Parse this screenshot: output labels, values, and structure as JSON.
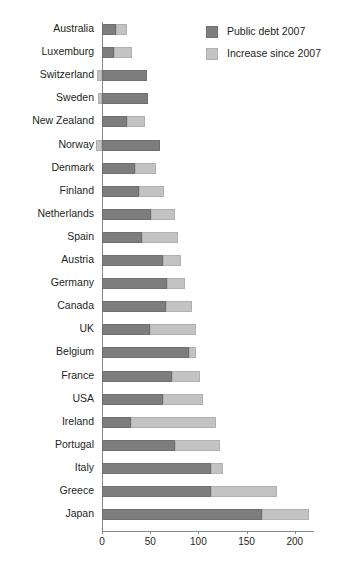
{
  "chart_data": {
    "type": "bar",
    "orientation": "horizontal",
    "stacked": true,
    "title": "",
    "subtitle": "",
    "xlabel": "",
    "ylabel": "",
    "xlim": [
      -10,
      225
    ],
    "xticks": [
      0,
      50,
      100,
      150,
      200
    ],
    "xticklabels": [
      "0",
      "50",
      "100",
      "150",
      "200"
    ],
    "grid": false,
    "legend_position": "top-right",
    "categories": [
      "Australia",
      "Luxemburg",
      "Switzerland",
      "Sweden",
      "New Zealand",
      "Norway",
      "Denmark",
      "Finland",
      "Netherlands",
      "Spain",
      "Austria",
      "Germany",
      "Canada",
      "UK",
      "Belgium",
      "France",
      "USA",
      "Ireland",
      "Portugal",
      "Italy",
      "Greece",
      "Japan"
    ],
    "series": [
      {
        "name": "Public debt 2007",
        "color": "#7d7d7d",
        "values": [
          15,
          12,
          47,
          48,
          26,
          60,
          34,
          38,
          51,
          41,
          63,
          67,
          66,
          50,
          90,
          73,
          63,
          30,
          76,
          113,
          113,
          166
        ]
      },
      {
        "name": "Increase since 2007",
        "color": "#c3c3c3",
        "values": [
          11,
          19,
          -5,
          -4,
          19,
          -6,
          22,
          26,
          25,
          38,
          19,
          19,
          27,
          48,
          8,
          29,
          42,
          88,
          46,
          13,
          69,
          49
        ]
      }
    ],
    "totals": [
      26,
      31,
      42,
      44,
      45,
      54,
      56,
      64,
      76,
      79,
      82,
      86,
      93,
      98,
      98,
      102,
      105,
      118,
      122,
      126,
      182,
      215
    ]
  },
  "legend": {
    "items": [
      {
        "label": "Public debt 2007",
        "color": "#7d7d7d"
      },
      {
        "label": "Increase since 2007",
        "color": "#c3c3c3"
      }
    ]
  },
  "axis": {
    "ticks": [
      "0",
      "50",
      "100",
      "150",
      "200"
    ]
  }
}
